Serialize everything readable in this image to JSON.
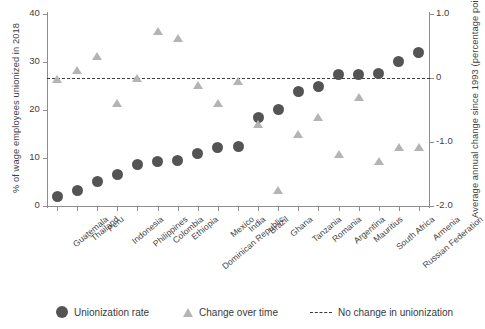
{
  "chart_data": {
    "type": "scatter",
    "title": "",
    "xlabel": "",
    "ylabel": "% of wage employees unionized in 2018",
    "y2label": "Average annual change since 1993 (percentage points)",
    "ylim": [
      0,
      40
    ],
    "y2lim": [
      -2.0,
      1.0
    ],
    "yticks": [
      "0",
      "10",
      "20",
      "30",
      "40"
    ],
    "ytick_values": [
      0,
      10,
      20,
      30,
      40
    ],
    "y2ticks": [
      "-2.0",
      "-1.0",
      "0",
      "1.0"
    ],
    "y2tick_values": [
      -2.0,
      -1.0,
      0,
      1.0
    ],
    "grid": false,
    "legend_position": "bottom",
    "reference_line": {
      "label": "No change in unionization",
      "y2_value": 0
    },
    "categories": [
      "Guatemala",
      "Thailand",
      "Peru",
      "Indonesia",
      "Philippines",
      "Colombia",
      "Ethiopia",
      "Dominican Republic",
      "Mexico",
      "India",
      "Brazil",
      "Ghana",
      "Tanzania",
      "Romania",
      "Argentina",
      "Mauritius",
      "South Africa",
      "Russian Federation",
      "Armenia"
    ],
    "series": [
      {
        "name": "Unionization rate",
        "marker": "circle",
        "color": "#545454",
        "axis": "left",
        "unit": "%",
        "values": [
          2.0,
          3.2,
          5.2,
          6.6,
          8.6,
          9.3,
          9.4,
          11.0,
          12.1,
          12.4,
          18.4,
          20.1,
          23.8,
          24.8,
          27.4,
          27.3,
          27.7,
          30.2,
          31.9
        ]
      },
      {
        "name": "Change over time",
        "marker": "triangle",
        "color": "#b4b4b4",
        "axis": "right",
        "unit": "pp",
        "values": [
          -0.02,
          0.12,
          0.33,
          -0.4,
          0.0,
          0.72,
          0.62,
          -0.11,
          -0.4,
          -0.06,
          -0.72,
          -1.75,
          -0.89,
          -0.62,
          -1.19,
          -0.3,
          -1.3,
          -1.09,
          -1.09
        ]
      }
    ]
  },
  "legend": {
    "items": [
      {
        "label": "Unionization rate",
        "marker": "circle"
      },
      {
        "label": "Change over time",
        "marker": "triangle"
      },
      {
        "label": "No change in unionization",
        "marker": "dashed-line"
      }
    ]
  }
}
